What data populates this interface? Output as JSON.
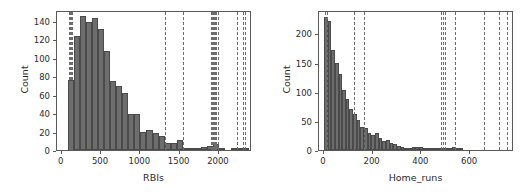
{
  "figure": {
    "background": "#ffffff",
    "bar_color": "#6d6d6d",
    "bar_edge_color": "#4a4a4a",
    "line_color": "#6d6d6d",
    "axis_color": "#5a5a5a",
    "text_color": "#2b2b2b"
  },
  "chart_data": [
    {
      "type": "bar",
      "title": "",
      "xlabel": "RBIs",
      "ylabel": "Count",
      "xlim": [
        -60,
        2420
      ],
      "ylim": [
        0,
        152
      ],
      "grid": false,
      "legend": "none",
      "xticks": [
        0,
        500,
        1000,
        1500,
        2000
      ],
      "xtick_labels": [
        "0",
        "500",
        "1000",
        "1500",
        "2000"
      ],
      "yticks": [
        0,
        20,
        40,
        60,
        80,
        100,
        120,
        140
      ],
      "ytick_labels": [
        "0",
        "20",
        "40",
        "60",
        "80",
        "100",
        "120",
        "140"
      ],
      "bin_width": 77,
      "bin_starts": [
        77,
        154,
        231,
        308,
        385,
        462,
        539,
        616,
        693,
        770,
        847,
        924,
        1001,
        1078,
        1155,
        1232,
        1309,
        1386,
        1463,
        1540,
        1617,
        1694,
        1771,
        1848,
        1925,
        2002,
        2079,
        2156,
        2233,
        2310
      ],
      "values": [
        76,
        124,
        145,
        139,
        143,
        131,
        107,
        75,
        70,
        62,
        39,
        39,
        20,
        22,
        19,
        15,
        8,
        8,
        11,
        1,
        2,
        2,
        3,
        4,
        6,
        1,
        0,
        1,
        1,
        1
      ],
      "vlines": [
        88,
        96,
        104,
        112,
        120,
        128,
        136,
        1317,
        1545,
        1900,
        1912,
        1924,
        1938,
        1952,
        1968,
        1990,
        2228,
        2300,
        2330
      ]
    },
    {
      "type": "bar",
      "title": "",
      "xlabel": "Home_runs",
      "ylabel": "Count",
      "xlim": [
        -20,
        780
      ],
      "ylim": [
        0,
        240
      ],
      "grid": false,
      "legend": "none",
      "xticks": [
        0,
        200,
        400,
        600
      ],
      "xtick_labels": [
        "0",
        "200",
        "400",
        "600"
      ],
      "yticks": [
        0,
        50,
        100,
        150,
        200
      ],
      "ytick_labels": [
        "0",
        "50",
        "100",
        "150",
        "200"
      ],
      "bin_width": 15,
      "bin_starts": [
        0,
        15,
        30,
        45,
        60,
        75,
        90,
        105,
        120,
        135,
        150,
        165,
        180,
        195,
        210,
        225,
        240,
        255,
        270,
        285,
        300,
        315,
        330,
        345,
        360,
        375,
        390,
        405,
        420,
        435,
        450,
        465,
        480,
        495,
        510,
        525,
        540,
        555,
        570,
        585,
        600,
        615,
        630,
        645,
        660,
        675,
        690,
        705,
        720,
        735
      ],
      "values": [
        228,
        222,
        172,
        150,
        130,
        103,
        88,
        70,
        62,
        52,
        40,
        37,
        30,
        25,
        30,
        20,
        16,
        18,
        12,
        10,
        7,
        5,
        4,
        4,
        6,
        5,
        6,
        4,
        2,
        1,
        1,
        1,
        4,
        2,
        1,
        6,
        1,
        1,
        0,
        0,
        0,
        0,
        0,
        0,
        0,
        0,
        0,
        0,
        0,
        0
      ],
      "vlines": [
        6,
        12,
        122,
        163,
        479,
        487,
        496,
        539,
        655,
        718,
        750
      ]
    }
  ]
}
